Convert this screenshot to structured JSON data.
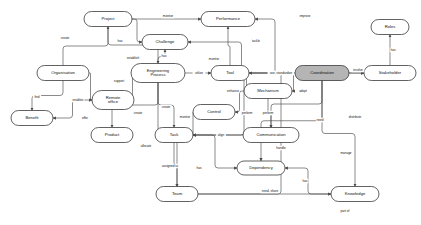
{
  "diagram": {
    "type": "concept-map",
    "canvas": {
      "width": 421,
      "height": 225
    },
    "colors": {
      "node_fill": "#ffffff",
      "node_fill_accent": "#b5b5b5",
      "node_stroke": "#3a3a3a",
      "edge_stroke": "#4a4a4a",
      "text": "#111111",
      "background": "#ffffff"
    },
    "nodes": [
      {
        "id": "project",
        "label": "Project",
        "x": 108,
        "y": 19,
        "w": 48,
        "h": 15,
        "accent": false
      },
      {
        "id": "performance",
        "label": "Performance",
        "x": 228,
        "y": 19,
        "w": 54,
        "h": 15,
        "accent": false
      },
      {
        "id": "roles",
        "label": "Roles",
        "x": 390,
        "y": 27,
        "w": 38,
        "h": 15,
        "accent": false
      },
      {
        "id": "challenge",
        "label": "Challenge",
        "x": 165,
        "y": 42,
        "w": 46,
        "h": 15,
        "accent": false
      },
      {
        "id": "organisation",
        "label": "Organisation",
        "x": 63,
        "y": 73,
        "w": 52,
        "h": 15,
        "accent": false
      },
      {
        "id": "engproc",
        "label": "Engineering\nProcess",
        "x": 158,
        "y": 73,
        "w": 54,
        "h": 19,
        "accent": false
      },
      {
        "id": "tool",
        "label": "Tool",
        "x": 230,
        "y": 73,
        "w": 38,
        "h": 15,
        "accent": false
      },
      {
        "id": "coordination",
        "label": "Coordination",
        "x": 322,
        "y": 73,
        "w": 54,
        "h": 15,
        "accent": true
      },
      {
        "id": "stakeholder",
        "label": "Stakeholder",
        "x": 390,
        "y": 73,
        "w": 52,
        "h": 15,
        "accent": false
      },
      {
        "id": "remoteoffice",
        "label": "Remote\noffice",
        "x": 113,
        "y": 100,
        "w": 42,
        "h": 19,
        "accent": false
      },
      {
        "id": "mechanism",
        "label": "Mechanism",
        "x": 268,
        "y": 91,
        "w": 48,
        "h": 15,
        "accent": false
      },
      {
        "id": "control",
        "label": "Control",
        "x": 214,
        "y": 112,
        "w": 42,
        "h": 15,
        "accent": false
      },
      {
        "id": "product",
        "label": "Product",
        "x": 112,
        "y": 135,
        "w": 42,
        "h": 15,
        "accent": false
      },
      {
        "id": "task",
        "label": "Task",
        "x": 174,
        "y": 135,
        "w": 38,
        "h": 15,
        "accent": false
      },
      {
        "id": "communication",
        "label": "Communication",
        "x": 271,
        "y": 135,
        "w": 56,
        "h": 15,
        "accent": false
      },
      {
        "id": "dependency",
        "label": "Dependency",
        "x": 261,
        "y": 168,
        "w": 48,
        "h": 14,
        "accent": false
      },
      {
        "id": "team",
        "label": "Team",
        "x": 177,
        "y": 194,
        "w": 42,
        "h": 15,
        "accent": false
      },
      {
        "id": "knowledge",
        "label": "Knowledge",
        "x": 355,
        "y": 194,
        "w": 48,
        "h": 15,
        "accent": false
      }
    ],
    "edges": [
      {
        "from": "project",
        "to": "performance",
        "label": "monitor",
        "lx": 168,
        "ly": 16
      },
      {
        "from": "coordination",
        "to": "performance",
        "label": "improve",
        "lx": 305,
        "ly": 16
      },
      {
        "from": "project",
        "to": "challenge",
        "label": "has",
        "lx": 120,
        "ly": 41
      },
      {
        "from": "coordination",
        "to": "challenge",
        "label": "tackle",
        "lx": 256,
        "ly": 41
      },
      {
        "from": "engproc",
        "to": "challenge",
        "label": "has",
        "lx": 164,
        "ly": 56
      },
      {
        "from": "project",
        "to": "engproc",
        "label": "establish",
        "lx": 133,
        "ly": 58
      },
      {
        "from": "tool",
        "to": "performance",
        "label": "monitor",
        "lx": 214,
        "ly": 59
      },
      {
        "from": "organisation",
        "to": "project",
        "label": "create",
        "lx": 65,
        "ly": 38
      },
      {
        "from": "organisation",
        "to": "benefit",
        "label": "find",
        "lx": 37,
        "ly": 97
      },
      {
        "from": "organisation",
        "to": "remoteoffice",
        "label": "enables",
        "lx": 78,
        "ly": 100
      },
      {
        "from": "remoteoffice",
        "to": "engproc",
        "label": "support",
        "lx": 119,
        "ly": 81
      },
      {
        "from": "remoteoffice",
        "to": "benefit",
        "label": "offer",
        "lx": 85,
        "ly": 118
      },
      {
        "from": "engproc",
        "to": "tool",
        "label": "utilize",
        "lx": 199,
        "ly": 73
      },
      {
        "from": "coordination",
        "to": "tool",
        "label": "use, standardize",
        "lx": 281,
        "ly": 73
      },
      {
        "from": "coordination",
        "to": "stakeholder",
        "label": "involve",
        "lx": 358,
        "ly": 70
      },
      {
        "from": "stakeholder",
        "to": "roles",
        "label": "has",
        "lx": 393,
        "ly": 50
      },
      {
        "from": "tool",
        "to": "mechanism",
        "label": "enhance",
        "lx": 233,
        "ly": 91
      },
      {
        "from": "coordination",
        "to": "mechanism",
        "label": "adopt",
        "lx": 303,
        "ly": 91
      },
      {
        "from": "engproc",
        "to": "product",
        "label": "create",
        "lx": 138,
        "ly": 113
      },
      {
        "from": "engproc",
        "to": "task",
        "label": "create",
        "lx": 166,
        "ly": 107
      },
      {
        "from": "control",
        "to": "task",
        "label": "monitor",
        "lx": 185,
        "ly": 117
      },
      {
        "from": "mechanism",
        "to": "control",
        "label": "perform",
        "lx": 247,
        "ly": 113
      },
      {
        "from": "mechanism",
        "to": "communication",
        "label": "perform",
        "lx": 268,
        "ly": 113
      },
      {
        "from": "communication",
        "to": "task",
        "label": "align",
        "lx": 221,
        "ly": 135
      },
      {
        "from": "coordination",
        "to": "communication",
        "label": "need",
        "lx": 320,
        "ly": 120
      },
      {
        "from": "coordination",
        "to": "task",
        "label": "handle",
        "lx": 281,
        "ly": 148
      },
      {
        "from": "engproc",
        "to": "team",
        "label": "allocate",
        "lx": 146,
        "ly": 146
      },
      {
        "from": "task",
        "to": "team",
        "label": "assigned to",
        "lx": 170,
        "ly": 166
      },
      {
        "from": "task",
        "to": "dependency",
        "label": "has",
        "lx": 199,
        "ly": 168
      },
      {
        "from": "coordination",
        "to": "dependency",
        "label": "manage",
        "lx": 346,
        "ly": 153
      },
      {
        "from": "knowledge",
        "to": "dependency",
        "label": "has",
        "lx": 305,
        "ly": 181
      },
      {
        "from": "team",
        "to": "knowledge",
        "label": "need, share",
        "lx": 270,
        "ly": 191
      },
      {
        "from": "coordination",
        "to": "knowledge",
        "label": "distribute",
        "lx": 355,
        "ly": 117
      },
      {
        "from": "team",
        "to": "stakeholder",
        "label": "part of",
        "lx": 345,
        "ly": 211
      }
    ],
    "extra_nodes": [
      {
        "id": "benefit",
        "label": "Benefit",
        "x": 32,
        "y": 118,
        "w": 42,
        "h": 15,
        "accent": false
      }
    ]
  }
}
